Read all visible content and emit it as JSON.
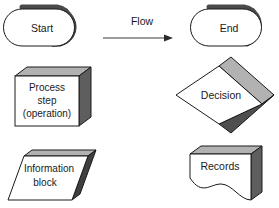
{
  "diagram": {
    "background_color": "#ffffff",
    "outline_color": "#1a1a1a",
    "face_color": "#ffffff",
    "top_face_color": "#b2b2b2",
    "side_face_color": "#5e5e5e",
    "text_color": "#1a1a1a"
  },
  "shapes": {
    "start": {
      "label": "Start",
      "type": "terminator-stadium"
    },
    "end": {
      "label": "End",
      "type": "terminator-stadium"
    },
    "process": {
      "label_line1": "Process",
      "label_line2": "step",
      "label_line3": "(operation)",
      "type": "process-box"
    },
    "decision": {
      "label": "Decision",
      "type": "decision-diamond"
    },
    "information": {
      "label_line1": "Information",
      "label_line2": "block",
      "type": "information-parallelogram"
    },
    "records": {
      "label": "Records",
      "type": "records-document"
    }
  },
  "connector": {
    "label": "Flow",
    "type": "arrow-right"
  }
}
